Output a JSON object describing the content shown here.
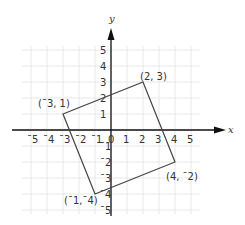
{
  "header_fragment": "y",
  "diagram": {
    "type": "coordinate-plane",
    "axes": {
      "x_label": "x",
      "y_label": "y",
      "x_ticks": [
        "ˉ5",
        "ˉ4",
        "ˉ3",
        "ˉ2",
        "ˉ1",
        "0",
        "1",
        "2",
        "3",
        "4",
        "5"
      ],
      "y_ticks": [
        "5",
        "4",
        "3",
        "2",
        "1",
        "ˉ1",
        "ˉ2",
        "ˉ3",
        "ˉ4",
        "ˉ5"
      ]
    },
    "polygon": {
      "vertices": [
        {
          "x": -3,
          "y": 1,
          "label": "(ˉ3, 1)"
        },
        {
          "x": 2,
          "y": 3,
          "label": "(2, 3)"
        },
        {
          "x": 4,
          "y": -2,
          "label": "(4, ˉ2)"
        },
        {
          "x": -1,
          "y": -4,
          "label": "(ˉ1,ˉ4)"
        }
      ]
    },
    "colors": {
      "grid": "#e6e6e6",
      "axis": "#111111",
      "shape": "#444444"
    }
  }
}
